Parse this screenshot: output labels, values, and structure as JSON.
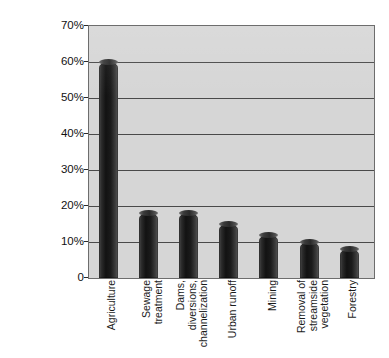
{
  "chart_data": {
    "type": "bar",
    "title": "",
    "xlabel": "",
    "ylabel": "Percent of impaired river miles",
    "ylim": [
      0,
      70
    ],
    "ytick_labels": [
      "70%",
      "60%",
      "50%",
      "40%",
      "30%",
      "20%",
      "10%",
      "0"
    ],
    "ytick_values": [
      70,
      60,
      50,
      40,
      30,
      20,
      10,
      0
    ],
    "grid": true,
    "legend": "none",
    "categories": [
      "Agriculture",
      "Sewage treatment",
      "Dams, diversions, channelization",
      "Urban runoff",
      "Mining",
      "Removal of streamside vegetation",
      "Forestry"
    ],
    "values": [
      60,
      18,
      18,
      15,
      12,
      10,
      8
    ],
    "series": [
      {
        "name": "Percent of impaired river miles",
        "values": [
          60,
          18,
          18,
          15,
          12,
          10,
          8
        ]
      }
    ]
  },
  "axis": {
    "y_title": "Percent of impaired river miles",
    "ticks": [
      {
        "label": "70%",
        "value": 70
      },
      {
        "label": "60%",
        "value": 60
      },
      {
        "label": "50%",
        "value": 50
      },
      {
        "label": "40%",
        "value": 40
      },
      {
        "label": "30%",
        "value": 30
      },
      {
        "label": "20%",
        "value": 20
      },
      {
        "label": "10%",
        "value": 10
      },
      {
        "label": "0",
        "value": 0
      }
    ]
  },
  "x_category_labels": [
    {
      "lines": [
        "Agriculture"
      ]
    },
    {
      "lines": [
        "Sewage",
        "treatment"
      ]
    },
    {
      "lines": [
        "Dams,",
        "diversions,",
        "channelization"
      ]
    },
    {
      "lines": [
        "Urban runoff"
      ]
    },
    {
      "lines": [
        "Mining"
      ]
    },
    {
      "lines": [
        "Removal of",
        "streamside",
        "vegetation"
      ]
    },
    {
      "lines": [
        "Forestry"
      ]
    }
  ],
  "colors": {
    "plot_background": "#d6d6d6",
    "plot_border": "#6d6d6d",
    "gridline": "#4a4a4a",
    "bar_dark": "#121212",
    "bar_light": "#6a6a6a",
    "text": "#1b1b1b",
    "page_background": "#ffffff"
  }
}
